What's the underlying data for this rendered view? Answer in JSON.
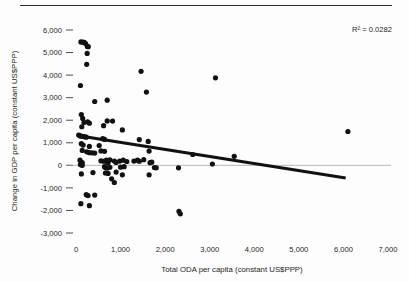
{
  "figure": {
    "has_top_rule": true,
    "background_color": "#fdfdfd"
  },
  "chart_data": {
    "type": "scatter",
    "title": "",
    "subtitle": "",
    "xlabel": "Total ODA per capita (constant US$PPP)",
    "ylabel": "Change in GDP per capita (constant US$PPP)",
    "xlim": [
      0,
      7000
    ],
    "ylim": [
      -3000,
      6000
    ],
    "xticks": [
      0,
      1000,
      2000,
      3000,
      4000,
      5000,
      6000,
      7000
    ],
    "xtick_labels": [
      "0",
      "1,000",
      "2,000",
      "3,000",
      "4,000",
      "5,000",
      "6,000",
      "7,000"
    ],
    "yticks": [
      -3000,
      -2000,
      -1000,
      0,
      1000,
      2000,
      3000,
      4000,
      5000,
      6000
    ],
    "ytick_labels": [
      "-3,000",
      "-2,000",
      "-1,000",
      "0",
      "1,000",
      "2,000",
      "3,000",
      "4,000",
      "5,000",
      "6,000"
    ],
    "grid": false,
    "legend": "none",
    "annotations": [
      {
        "name": "r-squared",
        "text": "R² = 0.0282",
        "x": 6000,
        "y": 5850
      }
    ],
    "zero_reference_line": {
      "y": 0,
      "color": "#9a9a9a"
    },
    "trendline": {
      "type": "linear",
      "color": "#111111",
      "x_start": 60,
      "y_start": 1310,
      "x_end": 6050,
      "y_end": -560,
      "r_squared": 0.0282
    },
    "marker": {
      "shape": "circle",
      "color": "#111111",
      "size": 2.6
    },
    "point_count": 95,
    "points": [
      [
        110,
        5470
      ],
      [
        150,
        5460
      ],
      [
        185,
        5450
      ],
      [
        215,
        5400
      ],
      [
        255,
        5270
      ],
      [
        275,
        5260
      ],
      [
        250,
        4960
      ],
      [
        240,
        4480
      ],
      [
        100,
        3540
      ],
      [
        1460,
        4170
      ],
      [
        3130,
        3880
      ],
      [
        1580,
        3250
      ],
      [
        120,
        2250
      ],
      [
        420,
        2830
      ],
      [
        700,
        2890
      ],
      [
        150,
        2080
      ],
      [
        180,
        1900
      ],
      [
        260,
        1930
      ],
      [
        300,
        1870
      ],
      [
        700,
        1970
      ],
      [
        820,
        1960
      ],
      [
        620,
        1760
      ],
      [
        130,
        1710
      ],
      [
        1040,
        1570
      ],
      [
        60,
        1340
      ],
      [
        90,
        1310
      ],
      [
        110,
        1300
      ],
      [
        140,
        1290
      ],
      [
        190,
        1270
      ],
      [
        230,
        1250
      ],
      [
        600,
        1180
      ],
      [
        640,
        1150
      ],
      [
        1420,
        1140
      ],
      [
        1620,
        1060
      ],
      [
        6100,
        1500
      ],
      [
        120,
        960
      ],
      [
        160,
        900
      ],
      [
        300,
        840
      ],
      [
        520,
        880
      ],
      [
        140,
        660
      ],
      [
        240,
        600
      ],
      [
        300,
        560
      ],
      [
        360,
        555
      ],
      [
        420,
        545
      ],
      [
        560,
        640
      ],
      [
        640,
        620
      ],
      [
        1640,
        630
      ],
      [
        2620,
        480
      ],
      [
        3550,
        400
      ],
      [
        90,
        230
      ],
      [
        140,
        120
      ],
      [
        560,
        200
      ],
      [
        620,
        180
      ],
      [
        680,
        230
      ],
      [
        700,
        160
      ],
      [
        720,
        120
      ],
      [
        760,
        240
      ],
      [
        860,
        190
      ],
      [
        900,
        130
      ],
      [
        980,
        190
      ],
      [
        1060,
        230
      ],
      [
        1140,
        170
      ],
      [
        1300,
        190
      ],
      [
        1380,
        230
      ],
      [
        1420,
        180
      ],
      [
        1520,
        250
      ],
      [
        1660,
        120
      ],
      [
        1700,
        140
      ],
      [
        100,
        40
      ],
      [
        120,
        20
      ],
      [
        140,
        0
      ],
      [
        3060,
        60
      ],
      [
        640,
        -60
      ],
      [
        660,
        -100
      ],
      [
        700,
        -120
      ],
      [
        760,
        -90
      ],
      [
        1000,
        -80
      ],
      [
        1080,
        -60
      ],
      [
        1760,
        -100
      ],
      [
        1800,
        -110
      ],
      [
        2300,
        -110
      ],
      [
        120,
        -380
      ],
      [
        380,
        -320
      ],
      [
        660,
        -340
      ],
      [
        720,
        -360
      ],
      [
        900,
        -300
      ],
      [
        1040,
        -420
      ],
      [
        1640,
        -420
      ],
      [
        800,
        -600
      ],
      [
        860,
        -760
      ],
      [
        230,
        -1300
      ],
      [
        270,
        -1340
      ],
      [
        420,
        -1320
      ],
      [
        110,
        -1700
      ],
      [
        300,
        -1790
      ],
      [
        2310,
        -2040
      ],
      [
        2340,
        -2150
      ]
    ]
  }
}
